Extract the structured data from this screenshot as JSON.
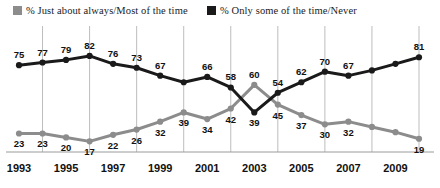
{
  "legend": {
    "items": [
      {
        "label": "% Just about always/Most of the time",
        "color": "#8c8c8c",
        "key": "gray"
      },
      {
        "label": "% Only some of the time/Never",
        "color": "#1a1a1a",
        "key": "black"
      }
    ]
  },
  "axis": {
    "tick_labels": [
      "1993",
      "1995",
      "1997",
      "1999",
      "2001",
      "2003",
      "2005",
      "2007",
      "2009"
    ]
  },
  "chart_data": {
    "type": "line",
    "title": "",
    "subtitle": "",
    "xlabel": "",
    "ylabel": "",
    "grid": true,
    "gridlines_at": [
      "1994",
      "1996",
      "1998",
      "2000",
      "2002",
      "2004",
      "2006",
      "2008",
      "2010"
    ],
    "legend_position": "top",
    "ylim": [
      0,
      100
    ],
    "x": [
      1993,
      1994,
      1995,
      1996,
      1997,
      1998,
      1999,
      2000,
      2001,
      2002,
      2003,
      2004,
      2005,
      2006,
      2007,
      2008,
      2009,
      2010
    ],
    "tick_years": [
      1993,
      1995,
      1997,
      1999,
      2001,
      2003,
      2005,
      2007,
      2009
    ],
    "series": [
      {
        "name": "% Only some of the time/Never",
        "color": "#1a1a1a",
        "values": [
          75,
          77,
          79,
          82,
          76,
          73,
          67,
          62,
          66,
          58,
          39,
          54,
          62,
          70,
          67,
          71,
          76,
          81
        ],
        "labels": [
          "75",
          "77",
          "79",
          "82",
          "76",
          "73",
          "67",
          "",
          "66",
          "58",
          "39",
          "54",
          "62",
          "70",
          "67",
          "",
          "",
          "81"
        ],
        "label_side": [
          "above",
          "above",
          "above",
          "above",
          "above",
          "above",
          "above",
          "",
          "above",
          "above",
          "below",
          "above",
          "above",
          "above",
          "above",
          "",
          "",
          "above"
        ]
      },
      {
        "name": "% Just about always/Most of the time",
        "color": "#8c8c8c",
        "values": [
          23,
          23,
          20,
          17,
          22,
          26,
          32,
          39,
          34,
          42,
          60,
          45,
          37,
          30,
          32,
          28,
          24,
          19
        ],
        "labels": [
          "23",
          "23",
          "20",
          "17",
          "22",
          "26",
          "32",
          "39",
          "34",
          "42",
          "60",
          "45",
          "37",
          "30",
          "32",
          "",
          "",
          "19"
        ],
        "label_side": [
          "below",
          "below",
          "below",
          "below",
          "below",
          "below",
          "below",
          "below",
          "below",
          "below",
          "above",
          "below",
          "below",
          "below",
          "below",
          "",
          "",
          "below"
        ]
      }
    ]
  }
}
